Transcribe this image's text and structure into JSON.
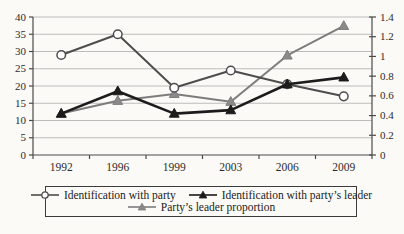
{
  "figure": {
    "background_color": "#fbfaf6",
    "axis_color": "#4a4a4a",
    "grid_color": "#bcbcbc",
    "text_color": "#2b2b2b"
  },
  "chart_data": {
    "type": "line",
    "title": "",
    "categories": [
      "1992",
      "1996",
      "1999",
      "2003",
      "2006",
      "2009"
    ],
    "left_axis": {
      "label": "",
      "min": 0,
      "max": 40,
      "tick_labels": [
        "0",
        "5",
        "10",
        "15",
        "20",
        "25",
        "30",
        "35",
        "40"
      ]
    },
    "right_axis": {
      "label": "",
      "min": 0,
      "max": 1.4,
      "tick_labels": [
        "0",
        "0.2",
        "0.4",
        "0.6",
        "0.8",
        "1",
        "1.2",
        "1.4"
      ]
    },
    "grid": true,
    "legend_position": "bottom-boxed",
    "series": [
      {
        "name": "Identification with party",
        "axis": "left",
        "marker": "circle-open",
        "line_color": "#4d4d4d",
        "marker_fill": "#ffffff",
        "line_width": 2,
        "values": [
          29,
          35,
          19.5,
          24.5,
          20.5,
          17
        ]
      },
      {
        "name": "Identification with party’s leader",
        "axis": "left",
        "marker": "triangle-filled",
        "line_color": "#1c1c1c",
        "marker_fill": "#1c1c1c",
        "line_width": 2.6,
        "values": [
          12,
          18.5,
          12,
          13,
          20.5,
          22.5
        ]
      },
      {
        "name": "Party’s leader proportion",
        "axis": "right",
        "marker": "triangle-filled",
        "line_color": "#7d7d7d",
        "marker_fill": "#8a8a8a",
        "line_width": 2,
        "values": [
          0.42,
          0.55,
          0.62,
          0.54,
          1.01,
          1.31
        ]
      }
    ]
  }
}
